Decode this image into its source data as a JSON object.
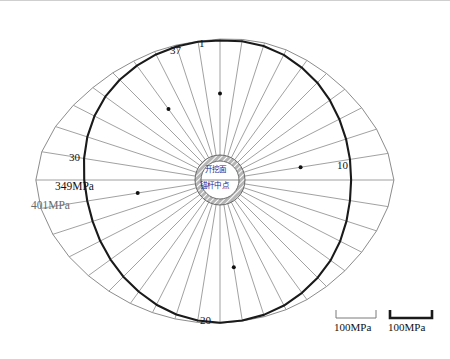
{
  "figure": {
    "title_present": false,
    "center_labels": {
      "line1": "开挖面",
      "line2": "锚杆中点"
    },
    "spoke_labels": [
      {
        "id": "1",
        "text": "1",
        "angle_deg": 90,
        "dot": true
      },
      {
        "id": "10",
        "text": "10",
        "angle_deg": 0,
        "dot": true
      },
      {
        "id": "20",
        "text": "20",
        "angle_deg": 270,
        "dot": true
      },
      {
        "id": "30",
        "text": "30",
        "angle_deg": 171,
        "dot": true
      },
      {
        "id": "37",
        "text": "37",
        "angle_deg": 117,
        "dot": true
      }
    ],
    "curve_labels": [
      {
        "id": "inner",
        "text": "349MPa",
        "color": "#222222"
      },
      {
        "id": "outer",
        "text": "401MPa",
        "color": "#7a7a7a"
      }
    ],
    "scale_bars": [
      {
        "id": "thin",
        "label": "100MPa",
        "stroke": "#7a7a7a",
        "thickness": 1
      },
      {
        "id": "thick",
        "label": "100MPa",
        "stroke": "#1a1a1a",
        "thickness": 2.6
      }
    ],
    "colors": {
      "thick_curve": "#1a1a1a",
      "thin_curve": "#8c8c8c",
      "spoke": "#6e6e6e",
      "hatch": "#555555",
      "background": "#ffffff"
    }
  },
  "chart_data": {
    "type": "line",
    "plot_kind": "polar-radar",
    "title": "",
    "xlabel": "",
    "ylabel": "",
    "legend_position": "none",
    "grid": false,
    "n_spokes": 40,
    "spoke_step_deg": 9,
    "center_px": [
      220,
      180
    ],
    "units": "MPa",
    "scale_reference_MPa": 100,
    "categories": [
      1,
      2,
      3,
      4,
      5,
      6,
      7,
      8,
      9,
      10,
      11,
      12,
      13,
      14,
      15,
      16,
      17,
      18,
      19,
      20,
      21,
      22,
      23,
      24,
      25,
      26,
      27,
      28,
      29,
      30,
      31,
      32,
      33,
      34,
      35,
      36,
      37,
      38,
      39,
      40
    ],
    "angles_deg": [
      90,
      81,
      72,
      63,
      54,
      45,
      36,
      27,
      18,
      9,
      0,
      351,
      342,
      333,
      324,
      315,
      306,
      297,
      288,
      279,
      270,
      261,
      252,
      243,
      234,
      225,
      216,
      207,
      198,
      189,
      180,
      171,
      162,
      153,
      144,
      135,
      126,
      117,
      108,
      99
    ],
    "series": [
      {
        "name": "349MPa",
        "style": "thick-black",
        "max_value": 349,
        "values": [
          300,
          302,
          303,
          302,
          299,
          296,
          292,
          288,
          285,
          283,
          282,
          283,
          286,
          290,
          294,
          297,
          300,
          303,
          305,
          306,
          307,
          306,
          304,
          301,
          297,
          294,
          291,
          289,
          288,
          289,
          292,
          296,
          300,
          303,
          305,
          305,
          304,
          303,
          302,
          301
        ]
      },
      {
        "name": "401MPa",
        "style": "thin-gray",
        "max_value": 401,
        "values": [
          303,
          306,
          310,
          314,
          318,
          324,
          332,
          342,
          354,
          366,
          374,
          366,
          354,
          342,
          332,
          324,
          318,
          313,
          309,
          307,
          308,
          310,
          314,
          320,
          328,
          338,
          350,
          364,
          378,
          390,
          396,
          388,
          372,
          354,
          338,
          326,
          316,
          310,
          305,
          302
        ]
      }
    ],
    "annotations": [
      {
        "text": "349MPa",
        "at_spoke": 32,
        "role": "inner-curve-label"
      },
      {
        "text": "401MPa",
        "at_spoke": 31,
        "role": "outer-curve-label"
      },
      {
        "text": "开挖面",
        "role": "center-label-1"
      },
      {
        "text": "锚杆中点",
        "role": "center-label-2"
      }
    ]
  }
}
